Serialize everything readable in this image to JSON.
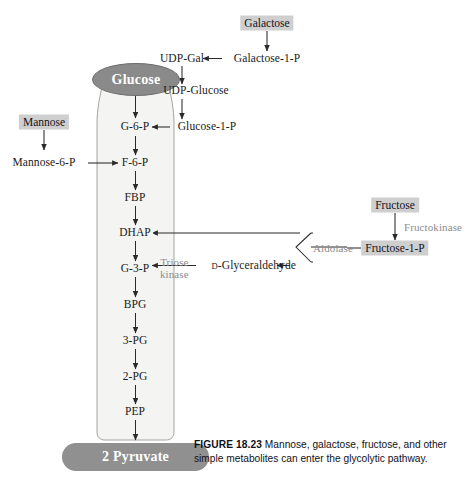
{
  "figure": {
    "number_label": "FIGURE 18.23",
    "caption_text": "Mannose, galactose, fructose, and other simple metabolites can enter the glycolytic pathway."
  },
  "colors": {
    "chip_fill": "#cfcfcf",
    "glucose_fill": "#8a8a8a",
    "pyruvate_fill": "#909090",
    "funnel_fill": "#f4f4f2",
    "enzyme_text": "#8d8d8d",
    "body_text": "#1a1a20",
    "stroke": "#2a2a2a"
  },
  "glycolysis_column": {
    "top_node": {
      "label": "Glucose",
      "shape": "oval"
    },
    "bottom_node": {
      "label": "2 Pyruvate",
      "shape": "rounded-rect"
    },
    "intermediates": [
      {
        "label": "G-6-P"
      },
      {
        "label": "F-6-P"
      },
      {
        "label": "FBP"
      },
      {
        "label": "DHAP"
      },
      {
        "label": "G-3-P"
      },
      {
        "label": "BPG"
      },
      {
        "label": "3-PG"
      },
      {
        "label": "2-PG"
      },
      {
        "label": "PEP"
      }
    ]
  },
  "galactose_branch": {
    "substrate": "Galactose",
    "nodes": [
      {
        "label": "Galactose-1-P"
      },
      {
        "label": "UDP-Gal"
      },
      {
        "label": "UDP-Glucose"
      },
      {
        "label": "Glucose-1-P"
      }
    ]
  },
  "mannose_branch": {
    "substrate": "Mannose",
    "nodes": [
      {
        "label": "Mannose-6-P"
      }
    ]
  },
  "fructose_branch": {
    "substrate": "Fructose",
    "nodes": [
      {
        "label": "Fructose-1-P"
      },
      {
        "label": "D-Glyceraldehyde",
        "prefix": "D",
        "stem": "-Glyceraldehyde"
      }
    ],
    "enzymes": [
      {
        "label": "Fructokinase"
      },
      {
        "label": "Aldolase"
      },
      {
        "label": "Triose kinase",
        "line1": "Triose",
        "line2": "kinase"
      }
    ]
  }
}
